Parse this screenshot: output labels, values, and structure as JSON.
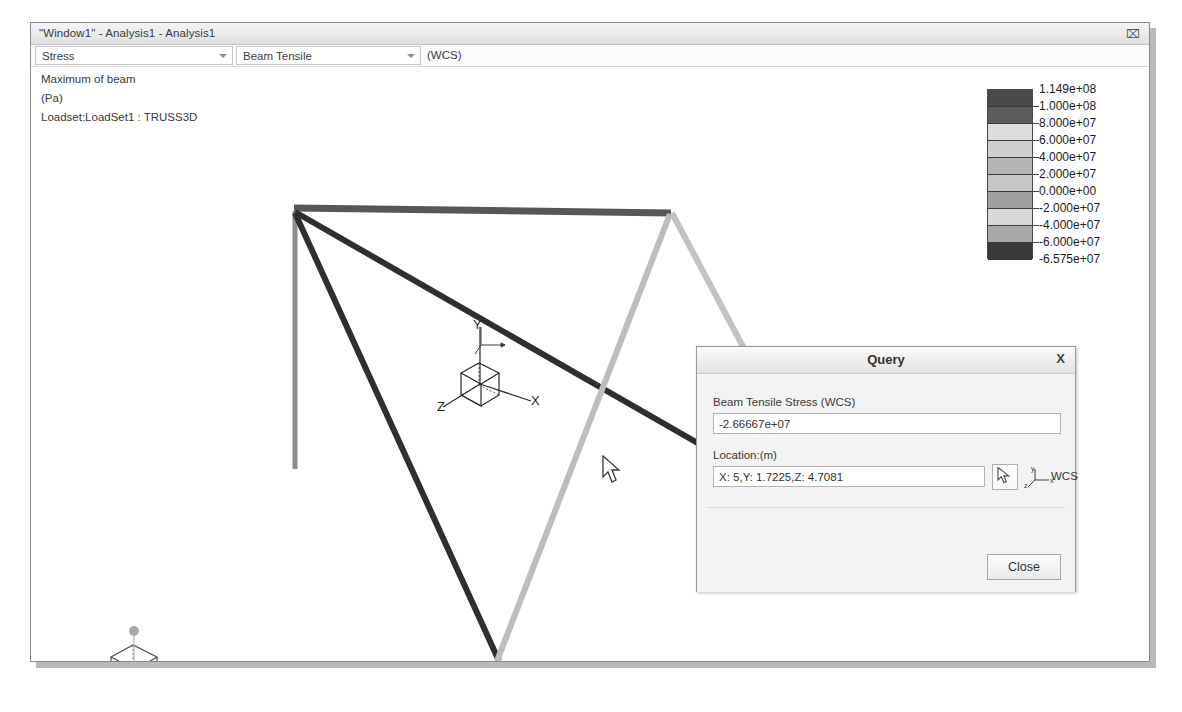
{
  "window": {
    "title": "\"Window1\" - Analysis1 - Analysis1",
    "close_label": "⌧",
    "close_icon": "close-icon"
  },
  "selectors": {
    "quantity": "Stress",
    "component": "Beam Tensile",
    "coordinate_system_note": "(WCS)",
    "arrow_icon": "chevron-down-icon"
  },
  "annotations": {
    "maximum": "Maximum of beam",
    "units": "(Pa)",
    "loadset": "Loadset:LoadSet1 : TRUSS3D"
  },
  "legend": {
    "labels": [
      "1.149e+08",
      "1.000e+08",
      "8.000e+07",
      "6.000e+07",
      "4.000e+07",
      "2.000e+07",
      "0.000e+00",
      "-2.000e+07",
      "-4.000e+07",
      "-6.000e+07",
      "-6.575e+07"
    ],
    "colors": [
      "#4a4a4a",
      "#5c5c5c",
      "#dcdcdc",
      "#cfcfcf",
      "#b4b4b4",
      "#c6c6c6",
      "#9e9e9e",
      "#d8d8d8",
      "#a8a8a8",
      "#3a3a3a"
    ],
    "max_value": "1.149e+08",
    "min_value": "-6.575e+07"
  },
  "query_dialog": {
    "title": "Query",
    "close_x": "X",
    "stress_label": "Beam Tensile Stress (WCS)",
    "stress_value": "-2.66667e+07",
    "location_label": "Location:(m)",
    "location_value": "X: 5,Y: 1.7225,Z: 4.7081",
    "wcs_label": "WCS",
    "pick_icon": "pick-cursor-icon",
    "close_button": "Close"
  },
  "toolbar": {
    "buttons": [
      {
        "name": "zoom-window-icon",
        "title": "Zoom window",
        "active": false
      },
      {
        "name": "zoom-in-icon",
        "title": "Zoom in",
        "active": false
      },
      {
        "name": "zoom-out-icon",
        "title": "Zoom out",
        "active": false
      },
      {
        "name": "refit-icon",
        "title": "Refit",
        "active": false
      },
      {
        "name": "saved-views-icon",
        "title": "Saved views",
        "active": false
      },
      {
        "name": "dynamic-query-icon",
        "title": "Dynamic query",
        "active": false
      },
      {
        "name": "query-tool-icon",
        "title": "Query",
        "active": true
      },
      {
        "name": "probe-tool-icon",
        "title": "Probe",
        "active": false
      }
    ]
  },
  "triad": {
    "axis_x": "X",
    "axis_y": "Y",
    "axis_z": "Z",
    "mini_x": "x",
    "mini_y": "y",
    "mini_z": "z"
  },
  "chart_data": {
    "type": "scatter",
    "xlabel": "X",
    "ylabel": "Y",
    "legend_scale": {
      "max": 114900000,
      "min": -65750000,
      "ticks": [
        114900000,
        100000000,
        80000000,
        60000000,
        40000000,
        20000000,
        0,
        -20000000,
        -40000000,
        -60000000,
        -65750000
      ]
    },
    "queried_point": {
      "beam_tensile_stress_pa": -26666700,
      "location_m": {
        "x": 5,
        "y": 1.7225,
        "z": 4.7081
      }
    },
    "members": [
      {
        "name": "top-chord-rear",
        "shade": "#5a5a5a",
        "x1": 263,
        "y1": 141,
        "x2": 638,
        "y2": 146
      },
      {
        "name": "column-left",
        "shade": "#8a8a8a",
        "x1": 264,
        "y1": 145,
        "x2": 264,
        "y2": 400
      },
      {
        "name": "diagonal-main",
        "shade": "#3a3a3a",
        "x1": 264,
        "y1": 146,
        "x2": 700,
        "y2": 399
      },
      {
        "name": "diagonal-lower",
        "shade": "#3a3a3a",
        "x1": 264,
        "y1": 147,
        "x2": 466,
        "y2": 593
      },
      {
        "name": "diagonal-right",
        "shade": "#b8b8b8",
        "x1": 638,
        "y1": 146,
        "x2": 466,
        "y2": 593
      },
      {
        "name": "right-leg",
        "shade": "#bcbcbc",
        "x1": 641,
        "y1": 146,
        "x2": 722,
        "y2": 300
      }
    ]
  }
}
